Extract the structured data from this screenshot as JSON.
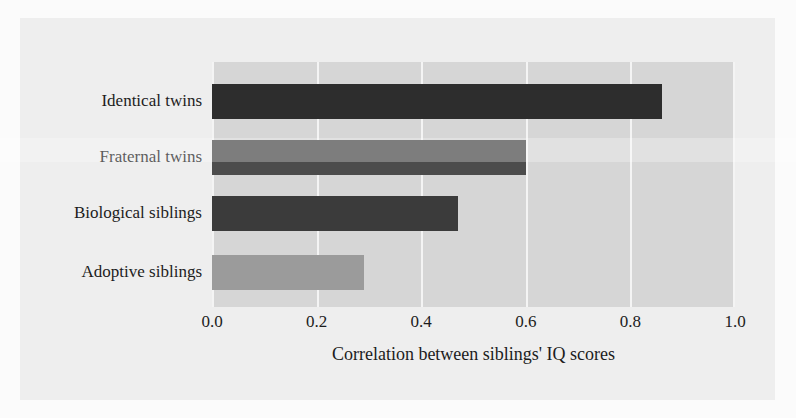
{
  "chart_data": {
    "type": "bar",
    "orientation": "horizontal",
    "title": "",
    "categories": [
      "Identical twins",
      "Fraternal twins",
      "Biological siblings",
      "Adoptive siblings"
    ],
    "values": [
      0.86,
      0.6,
      0.47,
      0.29
    ],
    "series": [
      {
        "name": "Correlation between siblings' IQ scores",
        "values": [
          0.86,
          0.6,
          0.47,
          0.29
        ]
      }
    ],
    "bar_colors": [
      "#2d2d2d",
      "#4c4c4c",
      "#3b3b3b",
      "#9b9b9b"
    ],
    "xlabel": "Correlation between siblings' IQ scores",
    "ylabel": "",
    "xlim": [
      0.0,
      1.0
    ],
    "xticks": [
      "0.0",
      "0.2",
      "0.4",
      "0.6",
      "0.8",
      "1.0"
    ],
    "xtick_values": [
      0.0,
      0.2,
      0.4,
      0.6,
      0.8,
      1.0
    ],
    "grid": "vertical",
    "gridline_color": "#f4f4f4",
    "plot_background": "#d6d6d6",
    "page_background": "#eeeeee",
    "legend": "none"
  }
}
